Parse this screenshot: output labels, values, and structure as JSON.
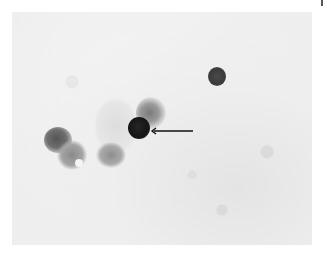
{
  "figure": {
    "type": "grayscale light micrograph",
    "annotations": [
      {
        "kind": "arrow",
        "direction": "left",
        "points_to": "dark round stained cell"
      }
    ],
    "colors": {
      "background": "#ececec",
      "target_cell": "#151515",
      "secondary_cell": "#3a3a3a",
      "arrow": "#111111"
    }
  }
}
